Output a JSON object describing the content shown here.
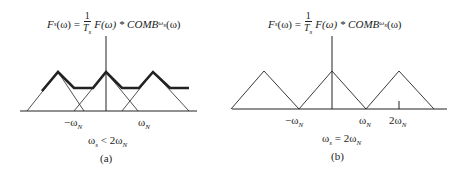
{
  "panels": [
    {
      "id": "a",
      "equation": {
        "lhs": "F",
        "lhs_sub": "s",
        "lhs_arg": "(ω) = ",
        "frac_num": "1",
        "frac_den": "T",
        "frac_den_sub": "s",
        "rhs": "F(ω) * COMB",
        "rhs_sub": "ω",
        "rhs_sub2": "s",
        "rhs_arg": "(ω)"
      },
      "tick_labels": {
        "neg": "−ω",
        "neg_sub": "N",
        "pos": "ω",
        "pos_sub": "N"
      },
      "condition": {
        "text": "ω",
        "sub1": "s",
        "rel": " < 2ω",
        "sub2": "N"
      },
      "caption": "(a)"
    },
    {
      "id": "b",
      "equation": {
        "lhs": "F",
        "lhs_sub": "s",
        "lhs_arg": "(ω) = ",
        "frac_num": "1",
        "frac_den": "T",
        "frac_den_sub": "s",
        "rhs": "F(ω) * COMB",
        "rhs_sub": "ω",
        "rhs_sub2": "s",
        "rhs_arg": "(ω)"
      },
      "tick_labels": {
        "neg": "−ω",
        "neg_sub": "N",
        "pos": "ω",
        "pos_sub": "N",
        "pos2": "2ω",
        "pos2_sub": "N"
      },
      "condition": {
        "text": "ω",
        "sub1": "s",
        "rel": " = 2ω",
        "sub2": "N"
      },
      "caption": "(b)"
    }
  ],
  "colors": {
    "line": "#222222",
    "background": "#ffffff"
  }
}
